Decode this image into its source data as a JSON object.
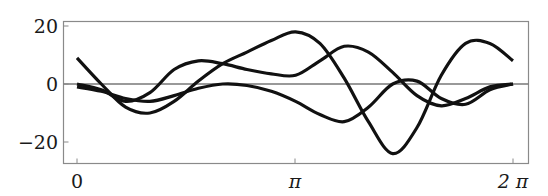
{
  "chart_data": {
    "type": "line",
    "title": "",
    "xlabel": "",
    "ylabel": "",
    "xlim": [
      0,
      6.2832
    ],
    "ylim": [
      -27,
      22
    ],
    "grid": false,
    "legend": null,
    "x_ticks": [
      {
        "value": 0,
        "label": "0"
      },
      {
        "value": 3.1416,
        "label": "π"
      },
      {
        "value": 6.2832,
        "label": "2 π"
      }
    ],
    "y_ticks": [
      {
        "value": 20,
        "label": "20"
      },
      {
        "value": 0,
        "label": "0"
      },
      {
        "value": -20,
        "label": "−20"
      }
    ],
    "reference_lines": [
      {
        "axis": "y",
        "value": 0
      }
    ],
    "x": [
      0,
      0.35,
      0.7,
      1.05,
      1.4,
      1.75,
      2.1,
      2.45,
      2.8,
      3.15,
      3.5,
      3.85,
      4.2,
      4.55,
      4.9,
      5.25,
      5.6,
      5.95,
      6.2832
    ],
    "series": [
      {
        "name": "curve-1",
        "values": [
          9,
          0,
          -8,
          -10,
          -6,
          1,
          7,
          11,
          15,
          18,
          14,
          2,
          -13,
          -24,
          -15,
          3,
          14,
          14,
          8
        ]
      },
      {
        "name": "curve-2",
        "values": [
          0,
          -2,
          -6,
          -3,
          5,
          8,
          7,
          5,
          3.5,
          3,
          8,
          13,
          11,
          4,
          -4,
          -7.5,
          -5,
          -1,
          0
        ]
      },
      {
        "name": "curve-3",
        "values": [
          -1,
          -2.5,
          -5,
          -6,
          -4,
          -1.5,
          0,
          -0.5,
          -2.5,
          -6,
          -10.5,
          -13,
          -8,
          0,
          1,
          -5,
          -7,
          -2,
          0
        ]
      }
    ],
    "line_color": "#111111",
    "axis_color": "#777777"
  }
}
